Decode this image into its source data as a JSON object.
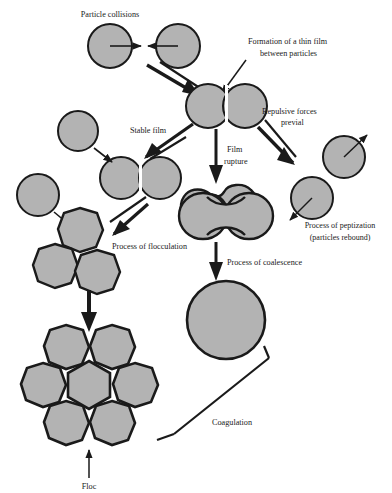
{
  "figure": {
    "type": "process-diagram",
    "background_color": "#ffffff",
    "particle_fill": "#b3b3b3",
    "particle_stroke": "#1a1a1a",
    "arrow_color": "#1a1a1a",
    "text_color": "#1a1a1a"
  },
  "labels": {
    "particle_collisions": "Particle collisions",
    "thin_film_line1": "Formation of a thin film",
    "thin_film_line2": "between particles",
    "stable_film": "Stable film",
    "repulsive_line1": "Repulsive forces",
    "repulsive_line2": "previal",
    "film_rupture_line1": "Film",
    "film_rupture_line2": "rupture",
    "peptization_line1": "Process of peptization",
    "peptization_line2": "(particles rebound)",
    "flocculation": "Process of flocculation",
    "coalescence": "Process of coalescence",
    "coagulation": "Coagulation",
    "floc": "Floc"
  },
  "nodes": [
    {
      "name": "collision-particle-left",
      "shape": "circle",
      "cx": 110,
      "cy": 46,
      "r": 22
    },
    {
      "name": "collision-particle-right",
      "shape": "circle",
      "cx": 178,
      "cy": 46,
      "r": 22
    },
    {
      "name": "thin-film-pair-left",
      "shape": "circle",
      "cx": 208,
      "cy": 106,
      "r": 22
    },
    {
      "name": "thin-film-pair-right",
      "shape": "circle",
      "cx": 245,
      "cy": 106,
      "r": 22
    },
    {
      "name": "stable-film-pair-left",
      "shape": "circle",
      "cx": 121,
      "cy": 178,
      "r": 21
    },
    {
      "name": "stable-film-pair-right",
      "shape": "circle",
      "cx": 160,
      "cy": 178,
      "r": 21
    },
    {
      "name": "free-particle-upper-left",
      "shape": "circle",
      "cx": 78,
      "cy": 131,
      "r": 20
    },
    {
      "name": "free-particle-mid-left",
      "shape": "circle",
      "cx": 38,
      "cy": 195,
      "r": 21
    },
    {
      "name": "floccule-particle-a",
      "shape": "blob",
      "cx": 80,
      "cy": 230,
      "r": 22
    },
    {
      "name": "floccule-particle-b",
      "shape": "blob",
      "cx": 55,
      "cy": 266,
      "r": 22
    },
    {
      "name": "floccule-particle-c",
      "shape": "blob",
      "cx": 97,
      "cy": 272,
      "r": 22
    },
    {
      "name": "ruptured-film-dumbbell",
      "shape": "dumbbell",
      "cx": 225,
      "cy": 216
    },
    {
      "name": "coalesced-droplet",
      "shape": "circle",
      "cx": 226,
      "cy": 320,
      "r": 39
    },
    {
      "name": "peptization-particle-upper",
      "shape": "circle",
      "cx": 344,
      "cy": 157,
      "r": 21
    },
    {
      "name": "peptization-particle-lower",
      "shape": "circle",
      "cx": 312,
      "cy": 198,
      "r": 21
    },
    {
      "name": "floc-outer-particle-top-left",
      "shape": "blob",
      "cx": 66,
      "cy": 347,
      "r": 22
    },
    {
      "name": "floc-outer-particle-top-right",
      "shape": "blob",
      "cx": 112,
      "cy": 347,
      "r": 22
    },
    {
      "name": "floc-outer-particle-mid-left",
      "shape": "blob",
      "cx": 43,
      "cy": 385,
      "r": 22
    },
    {
      "name": "floc-outer-particle-mid-right",
      "shape": "blob",
      "cx": 135,
      "cy": 385,
      "r": 22
    },
    {
      "name": "floc-outer-particle-bottom-left",
      "shape": "blob",
      "cx": 66,
      "cy": 423,
      "r": 22
    },
    {
      "name": "floc-outer-particle-bottom-right",
      "shape": "blob",
      "cx": 112,
      "cy": 423,
      "r": 22
    },
    {
      "name": "floc-core-hexagon",
      "shape": "hexagon",
      "cx": 89,
      "cy": 385,
      "r": 26
    }
  ]
}
